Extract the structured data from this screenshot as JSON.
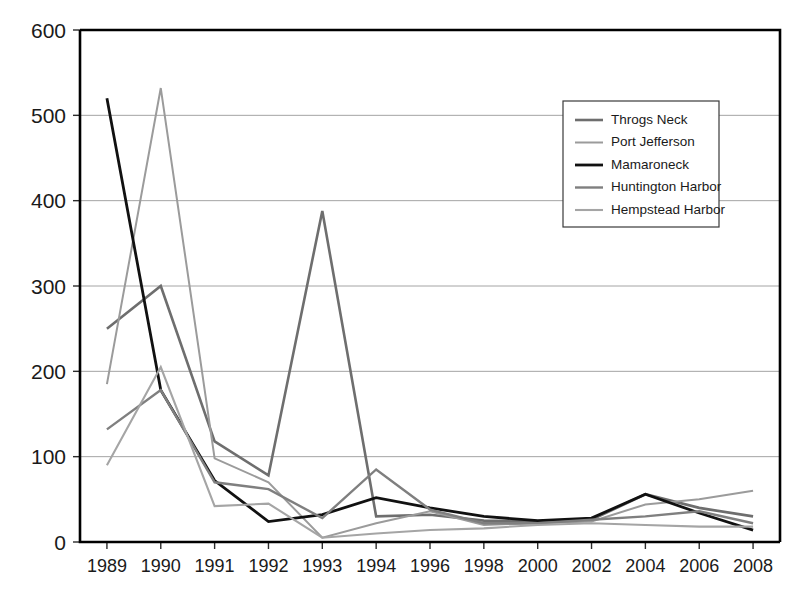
{
  "chart_data": {
    "type": "line",
    "title": "",
    "xlabel": "",
    "ylabel": "",
    "ylim": [
      0,
      600
    ],
    "ytick_step": 100,
    "yticks": [
      "0",
      "100",
      "200",
      "300",
      "400",
      "500",
      "600"
    ],
    "grid": "horizontal",
    "legend_position": "top-right",
    "categories": [
      "1989",
      "1990",
      "1991",
      "1992",
      "1993",
      "1994",
      "1996",
      "1998",
      "2000",
      "2002",
      "2004",
      "2006",
      "2008"
    ],
    "series": [
      {
        "name": "Throgs Neck",
        "color": "#6e6e6e",
        "width": 2.6,
        "values": [
          250,
          300,
          118,
          78,
          388,
          30,
          32,
          25,
          24,
          26,
          56,
          40,
          30
        ]
      },
      {
        "name": "Port Jefferson",
        "color": "#9b9b9b",
        "width": 2.0,
        "values": [
          185,
          532,
          98,
          70,
          5,
          22,
          36,
          20,
          22,
          24,
          44,
          50,
          60
        ]
      },
      {
        "name": "Mamaroneck",
        "color": "#111111",
        "width": 2.8,
        "values": [
          520,
          178,
          72,
          24,
          32,
          52,
          40,
          30,
          25,
          28,
          56,
          34,
          14
        ]
      },
      {
        "name": "Huntington Harbor",
        "color": "#7f7f7f",
        "width": 2.4,
        "values": [
          132,
          178,
          70,
          62,
          28,
          85,
          38,
          22,
          22,
          26,
          30,
          36,
          22
        ]
      },
      {
        "name": "Hempstead Harbor",
        "color": "#a5a5a5",
        "width": 2.1,
        "values": [
          90,
          205,
          42,
          45,
          5,
          10,
          14,
          16,
          20,
          22,
          20,
          18,
          18
        ]
      }
    ]
  },
  "legend": {
    "items": [
      {
        "label": "Throgs Neck"
      },
      {
        "label": "Port Jefferson"
      },
      {
        "label": "Mamaroneck"
      },
      {
        "label": "Huntington Harbor"
      },
      {
        "label": "Hempstead Harbor"
      }
    ]
  }
}
